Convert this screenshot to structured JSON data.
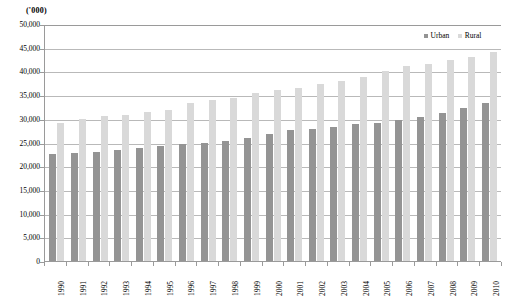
{
  "chart_data": {
    "type": "bar",
    "title": "",
    "subtitle": "",
    "unit_label": "('000)",
    "xlabel": "",
    "ylabel": "",
    "ylim": [
      0,
      50000
    ],
    "ytick_step": 5000,
    "ytick_labels": [
      "0",
      "5,000",
      "10,000",
      "15,000",
      "20,000",
      "25,000",
      "30,000",
      "35,000",
      "40,000",
      "45,000",
      "50,000"
    ],
    "ytick_values": [
      0,
      5000,
      10000,
      15000,
      20000,
      25000,
      30000,
      35000,
      40000,
      45000,
      50000
    ],
    "grid": true,
    "legend_position": "top-right",
    "categories": [
      "1990",
      "1991",
      "1992",
      "1993",
      "1994",
      "1995",
      "1996",
      "1997",
      "1998",
      "1999",
      "2000",
      "2001",
      "2002",
      "2003",
      "2004",
      "2005",
      "2006",
      "2007",
      "2008",
      "2009",
      "2010"
    ],
    "series": [
      {
        "name": "Urban",
        "color": "#949494",
        "values": [
          22500,
          22800,
          23100,
          23500,
          23800,
          24300,
          24600,
          24900,
          25400,
          26000,
          26800,
          27600,
          27900,
          28200,
          28900,
          29200,
          29800,
          30300,
          31300,
          32200,
          33400
        ]
      },
      {
        "name": "Rural",
        "color": "#d9d9d9",
        "values": [
          29100,
          29900,
          30500,
          30900,
          31500,
          31900,
          33300,
          33900,
          34300,
          35500,
          36000,
          36600,
          37300,
          38000,
          38900,
          40100,
          41100,
          41600,
          42400,
          43000,
          44000
        ]
      }
    ]
  },
  "legend": {
    "urban_label": "Urban",
    "rural_label": "Rural"
  }
}
